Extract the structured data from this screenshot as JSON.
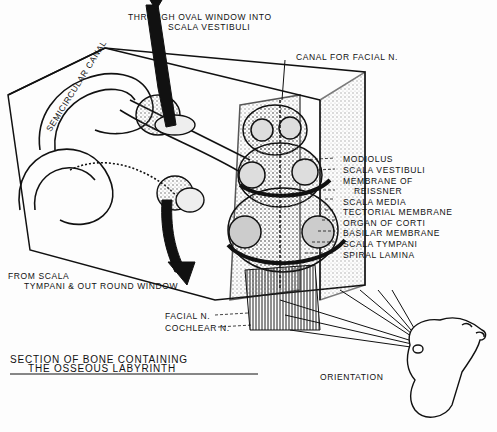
{
  "diagram": {
    "title_line1": "Section of bone containing",
    "title_line2": "the osseous labyrinth",
    "labels": {
      "oval_window_1": "Through oval window into",
      "oval_window_2": "scala vestibuli",
      "canal_facial": "Canal for facial n.",
      "semicircular": "Semicircular canal",
      "round_window_1": "From scala",
      "round_window_2": "tympani & out round window",
      "facial_n": "Facial n.",
      "cochlear_n": "Cochlear n.",
      "orientation": "Orientation"
    },
    "cochlea_labels": [
      "Modiolus",
      "Scala vestibuli",
      "Membrane of",
      "Reissner",
      "Scala media",
      "Tectorial membrane",
      "Organ of Corti",
      "Basilar membrane",
      "Scala tympani",
      "Spiral lamina"
    ],
    "colors": {
      "ink": "#111111",
      "paper": "#fdfdfd",
      "stipple": "#777777"
    }
  }
}
